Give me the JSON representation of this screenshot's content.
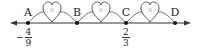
{
  "number_line": {
    "direction": "bidirectional",
    "line_color": "#333333",
    "points": [
      {
        "label": "A",
        "x": 28
      },
      {
        "label": "B",
        "x": 77
      },
      {
        "label": "C",
        "x": 126
      },
      {
        "label": "D",
        "x": 175
      }
    ],
    "values": {
      "A": {
        "sign": "−",
        "numerator": "4",
        "denominator": "9"
      },
      "C": {
        "sign": "",
        "numerator": "2",
        "denominator": "3"
      }
    },
    "hearts": [
      {
        "between": "A-B",
        "x": 52,
        "mark": "equal-interval"
      },
      {
        "between": "B-C",
        "x": 101,
        "mark": "equal-interval"
      },
      {
        "between": "C-D",
        "x": 150,
        "mark": "equal-interval"
      }
    ]
  }
}
